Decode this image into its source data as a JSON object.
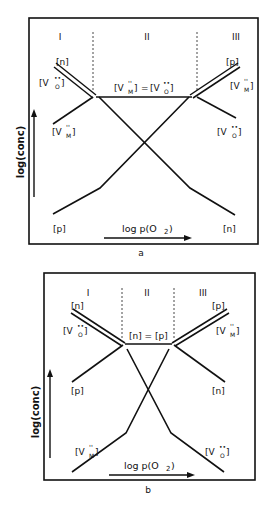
{
  "panels": [
    {
      "id": "a",
      "caption": "a",
      "regions": [
        "I",
        "II",
        "III"
      ],
      "y_axis_label": "log(conc)",
      "x_axis_label": "log p(O2)",
      "x_axis_label_main": "log p(O",
      "x_axis_label_sub": "2",
      "x_axis_label_close": ")",
      "plateau_label": "[V_M''] = [V_O••]",
      "curve_labels": {
        "left_top": "[n]",
        "left_second": "[V_O••]",
        "left_mid": "[V_M'']",
        "left_bottom": "[p]",
        "right_top": "[p]",
        "right_second": "[V_M'']",
        "right_mid": "[V_O••]",
        "right_bottom": "[n]"
      }
    },
    {
      "id": "b",
      "caption": "b",
      "regions": [
        "I",
        "II",
        "III"
      ],
      "y_axis_label": "log(conc)",
      "x_axis_label": "log p(O2)",
      "x_axis_label_main": "log p(O",
      "x_axis_label_sub": "2",
      "x_axis_label_close": ")",
      "plateau_label": "[n] = [p]",
      "curve_labels": {
        "left_top": "[n]",
        "left_second": "[V_O••]",
        "left_mid": "[p]",
        "left_bottom": "[V_M'']",
        "right_top": "[p]",
        "right_second": "[V_M'']",
        "right_mid": "[n]",
        "right_bottom": "[V_O••]"
      }
    }
  ],
  "text": {
    "a_caption": "a",
    "b_caption": "b",
    "reg1": "I",
    "reg2": "II",
    "reg3": "III",
    "ylab": "log(conc)",
    "xlab_main": "log  p(O",
    "xlab_sub": "2",
    "xlab_close": ")",
    "n": "[n]",
    "p": "[p]",
    "a_plateau_eq": "=",
    "b_plateau": "[n] = [p]",
    "V": "[V",
    "M": "M",
    "O": "O",
    "dprime": "''",
    "dots": "••",
    "close": "]"
  }
}
